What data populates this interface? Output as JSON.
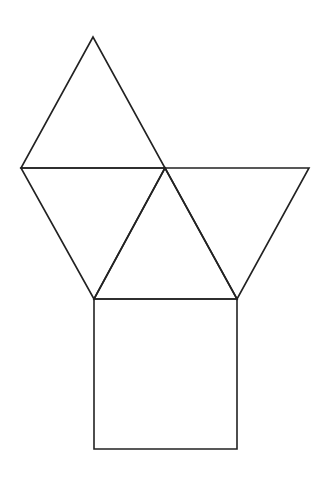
{
  "diagram": {
    "stroke_color": "#222222",
    "background": "#ffffff",
    "shapes": [
      {
        "id": "triangle-top",
        "type": "triangle",
        "points": "93,37 21,168 165,168"
      },
      {
        "id": "triangle-left",
        "type": "triangle",
        "points": "21,168 165,168 94,299"
      },
      {
        "id": "triangle-middle",
        "type": "triangle",
        "points": "165,168 94,299 237,299"
      },
      {
        "id": "triangle-right",
        "type": "triangle",
        "points": "165,168 309,168 237,299"
      },
      {
        "id": "square-bottom",
        "type": "square",
        "points": "94,299 237,299 237,449 94,449"
      }
    ]
  }
}
